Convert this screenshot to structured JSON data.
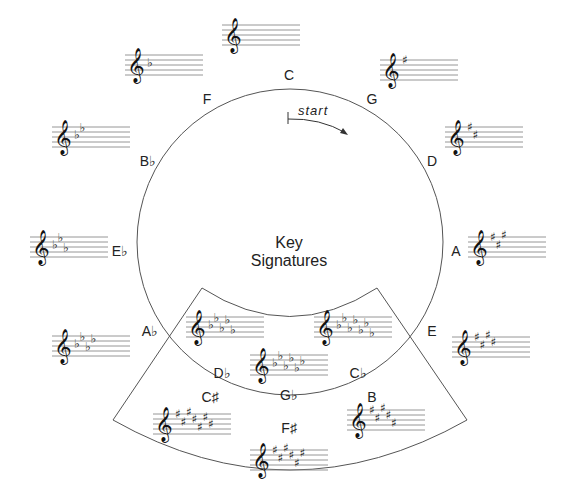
{
  "title": {
    "line1": "Key",
    "line2": "Signatures"
  },
  "start_label": "start",
  "colors": {
    "line": "#555555",
    "staff": "#8a8a8a",
    "text": "#222222"
  },
  "keys": [
    {
      "name": "C",
      "label": "C",
      "acc": "",
      "count": 0,
      "staff": {
        "x": 222,
        "y": 25,
        "w": 78
      },
      "label_pos": {
        "x": 289,
        "y": 80
      }
    },
    {
      "name": "G",
      "label": "G",
      "acc": "sharp",
      "count": 1,
      "staff": {
        "x": 380,
        "y": 60,
        "w": 78
      },
      "label_pos": {
        "x": 372,
        "y": 104
      }
    },
    {
      "name": "D",
      "label": "D",
      "acc": "sharp",
      "count": 2,
      "staff": {
        "x": 445,
        "y": 127,
        "w": 78
      },
      "label_pos": {
        "x": 432,
        "y": 166
      }
    },
    {
      "name": "A",
      "label": "A",
      "acc": "sharp",
      "count": 3,
      "staff": {
        "x": 468,
        "y": 237,
        "w": 78
      },
      "label_pos": {
        "x": 456,
        "y": 256
      }
    },
    {
      "name": "E",
      "label": "E",
      "acc": "sharp",
      "count": 4,
      "staff": {
        "x": 452,
        "y": 337,
        "w": 78
      },
      "label_pos": {
        "x": 432,
        "y": 336
      }
    },
    {
      "name": "B",
      "label": "B",
      "acc": "sharp",
      "count": 5,
      "staff": {
        "x": 347,
        "y": 410,
        "w": 78
      },
      "label_pos": {
        "x": 372,
        "y": 402
      }
    },
    {
      "name": "F#",
      "label": "F♯",
      "acc": "sharp",
      "count": 6,
      "staff": {
        "x": 250,
        "y": 450,
        "w": 78
      },
      "label_pos": {
        "x": 289,
        "y": 433
      }
    },
    {
      "name": "C#",
      "label": "C♯",
      "acc": "sharp",
      "count": 7,
      "staff": {
        "x": 153,
        "y": 414,
        "w": 78
      },
      "label_pos": {
        "x": 210,
        "y": 402
      }
    },
    {
      "name": "Cb",
      "label": "C♭",
      "acc": "flat",
      "count": 7,
      "staff": {
        "x": 314,
        "y": 317,
        "w": 78
      },
      "label_pos": {
        "x": 358,
        "y": 378
      }
    },
    {
      "name": "Gb",
      "label": "G♭",
      "acc": "flat",
      "count": 6,
      "staff": {
        "x": 250,
        "y": 355,
        "w": 78
      },
      "label_pos": {
        "x": 289,
        "y": 400
      }
    },
    {
      "name": "Db",
      "label": "D♭",
      "acc": "flat",
      "count": 5,
      "staff": {
        "x": 186,
        "y": 317,
        "w": 78
      },
      "label_pos": {
        "x": 222,
        "y": 378
      }
    },
    {
      "name": "Ab",
      "label": "A♭",
      "acc": "flat",
      "count": 4,
      "staff": {
        "x": 52,
        "y": 336,
        "w": 78
      },
      "label_pos": {
        "x": 150,
        "y": 336
      }
    },
    {
      "name": "Eb",
      "label": "E♭",
      "acc": "flat",
      "count": 3,
      "staff": {
        "x": 30,
        "y": 237,
        "w": 78
      },
      "label_pos": {
        "x": 120,
        "y": 256
      }
    },
    {
      "name": "Bb",
      "label": "B♭",
      "acc": "flat",
      "count": 2,
      "staff": {
        "x": 52,
        "y": 127,
        "w": 78
      },
      "label_pos": {
        "x": 148,
        "y": 166
      }
    },
    {
      "name": "F",
      "label": "F",
      "acc": "flat",
      "count": 1,
      "staff": {
        "x": 125,
        "y": 55,
        "w": 78
      },
      "label_pos": {
        "x": 207,
        "y": 104
      }
    }
  ]
}
